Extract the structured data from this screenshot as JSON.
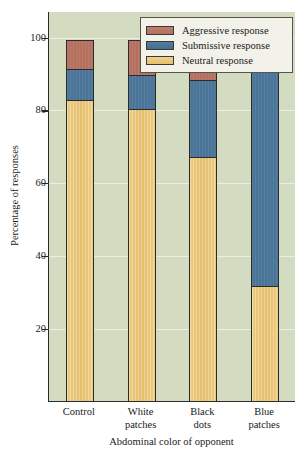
{
  "chart_data": {
    "type": "bar",
    "subtype": "stacked-bar",
    "title": "",
    "xlabel": "Abdominal color of opponent",
    "ylabel": "Percentage of responses",
    "categories": [
      "Control",
      "White patches",
      "Black dots",
      "Blue patches"
    ],
    "category_lines": [
      [
        "Control"
      ],
      [
        "White",
        "patches"
      ],
      [
        "Black",
        "dots"
      ],
      [
        "Blue",
        "patches"
      ]
    ],
    "series": [
      {
        "name": "Neutral response",
        "color": "#e4bf6c",
        "values": [
          82.5,
          80,
          67,
          31.5
        ]
      },
      {
        "name": "Submissive response",
        "color": "#4a7498",
        "values": [
          8.5,
          9.5,
          21,
          62
        ]
      },
      {
        "name": "Aggressive response",
        "color": "#b5705f",
        "values": [
          8,
          9.5,
          11,
          5.5
        ]
      }
    ],
    "stack_totals": [
      99,
      99,
      99,
      99
    ],
    "ylim": [
      0,
      107
    ],
    "yticks": [
      20,
      40,
      60,
      80,
      100
    ],
    "ytick_labels": [
      "20",
      "40",
      "60",
      "80",
      "100"
    ],
    "grid": true,
    "grid_axis": "y",
    "legend_position": "top-right",
    "plot_background": "#d3dcc0"
  },
  "legend": {
    "entries": [
      {
        "label": "Aggressive response",
        "swatch": "aggressive-swatch"
      },
      {
        "label": "Submissive response",
        "swatch": "submissive-swatch"
      },
      {
        "label": "Neutral response",
        "swatch": "neutral-swatch"
      }
    ]
  },
  "axes": {
    "y_label": "Percentage of responses",
    "x_label": "Abdominal color of opponent",
    "y_ticks": [
      "20",
      "40",
      "60",
      "80",
      "100"
    ]
  },
  "colors": {
    "aggressive": "#b5705f",
    "submissive": "#4a7498",
    "neutral": "#e4bf6c",
    "plot_background": "#d3dcc0",
    "axis": "#2b2b2b",
    "legend_background": "#f2f2ea"
  }
}
